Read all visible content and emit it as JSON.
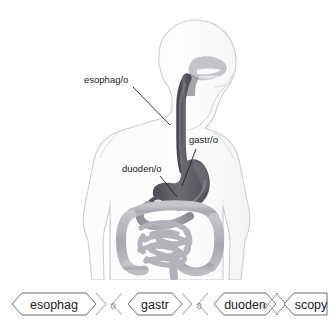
{
  "diagram": {
    "body_outline_color": "#c9c9cd",
    "organ_dark_color": "#5f5f64",
    "organ_light_color": "#a9a9ae",
    "leader_line_color": "#222222",
    "labels": [
      {
        "id": "esophagus",
        "text": "esophag/o",
        "text_x": 84,
        "text_y": 83,
        "leader_x1": 133,
        "leader_y1": 87,
        "leader_x2": 170,
        "leader_y2": 125
      },
      {
        "id": "stomach",
        "text": "gastr/o",
        "text_x": 189,
        "text_y": 143,
        "leader_x1": 196,
        "leader_y1": 149,
        "leader_x2": 182,
        "leader_y2": 186
      },
      {
        "id": "duodenum",
        "text": "duoden/o",
        "text_x": 122,
        "text_y": 172,
        "leader_x1": 160,
        "leader_y1": 176,
        "leader_x2": 177,
        "leader_y2": 197
      }
    ]
  },
  "word_strip": {
    "joiner": "o",
    "segments": [
      {
        "id": "esophag",
        "label": "esophag",
        "x": 12,
        "width": 82
      },
      {
        "id": "gastr",
        "label": "gastr",
        "x": 118,
        "width": 62
      },
      {
        "id": "duoden",
        "label": "duoden",
        "x": 200,
        "width": 76
      },
      {
        "id": "scopy",
        "label": "scopy",
        "x": 262,
        "width": 65
      }
    ]
  }
}
